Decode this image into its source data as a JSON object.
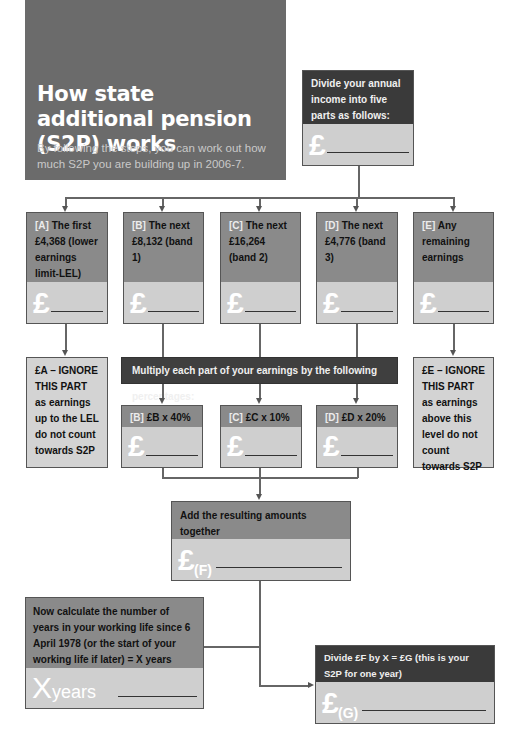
{
  "header": {
    "title": "How state additional pension (S2P) works",
    "subtitle": "By following the steps, you can work out how much S2P you are building up in 2006-7."
  },
  "divide_box": {
    "text": "Divide your annual income into five parts as follows:",
    "pound": "£"
  },
  "parts": [
    {
      "tag": "[A]",
      "text": "The first £4,368 (lower earnings limit-LEL)",
      "pound": "£"
    },
    {
      "tag": "[B]",
      "text": "The next £8,132 (band 1)",
      "pound": "£"
    },
    {
      "tag": "[C]",
      "text": "The next £16,264 (band 2)",
      "pound": "£"
    },
    {
      "tag": "[D]",
      "text": "The next £4,776 (band 3)",
      "pound": "£"
    },
    {
      "tag": "[E]",
      "text": "Any remaining earnings",
      "pound": "£"
    }
  ],
  "multiply_bar": "Multiply each part of your earnings by the following percentages:",
  "ignore_a": "£A – IGNORE THIS PART as earnings up to the LEL do not count towards S2P",
  "ignore_e": "£E – IGNORE THIS PART as earnings above this level do not count towards S2P",
  "calcs": [
    {
      "tag": "[B]",
      "text": "£B x 40% =",
      "pound": "£"
    },
    {
      "tag": "[C]",
      "text": "£C x 10% =",
      "pound": "£"
    },
    {
      "tag": "[D]",
      "text": "£D x 20% =",
      "pound": "£"
    }
  ],
  "sum_box": {
    "line1": "Add the resulting amounts together",
    "line2": "£b + £c + £d = £F",
    "pound": "£",
    "label": "(F)"
  },
  "years_box": {
    "text": "Now calculate the number of years in your working life since 6 April 1978 (or the start of your working life if later) = X years",
    "big": "X",
    "label": "years"
  },
  "result_box": {
    "text": "Divide £F by X = £G (this is your S2P for one year)",
    "pound": "£",
    "label": "(G)"
  }
}
